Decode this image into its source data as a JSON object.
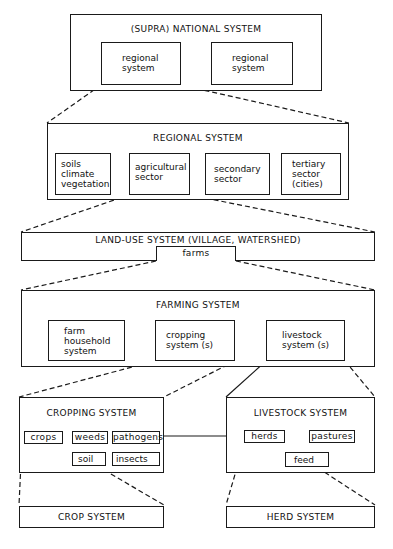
{
  "national": {
    "title": "(SUPRA) NATIONAL SYSTEM",
    "left_box": [
      "regional",
      "system"
    ],
    "right_box": [
      "regional",
      "system"
    ]
  },
  "regional": {
    "title": "REGIONAL SYSTEM",
    "boxes": [
      {
        "lines": [
          "soils",
          "climate",
          "vegetation"
        ]
      },
      {
        "lines": [
          "agricultural",
          "sector"
        ]
      },
      {
        "lines": [
          "secondary",
          "sector"
        ]
      },
      {
        "lines": [
          "tertiary",
          "sector",
          "(cities)"
        ]
      }
    ]
  },
  "landuse": {
    "title": "LAND-USE SYSTEM (VILLAGE, WATERSHED)",
    "farms": "farms"
  },
  "farming": {
    "title": "FARMING SYSTEM",
    "boxes": [
      {
        "lines": [
          "farm",
          "household",
          "system"
        ]
      },
      {
        "lines": [
          "cropping",
          "system (s)"
        ]
      },
      {
        "lines": [
          "livestock",
          "system (s)"
        ]
      }
    ]
  },
  "cropping": {
    "title": "CROPPING SYSTEM",
    "items": {
      "crops": "crops",
      "weeds": "weeds",
      "pathogens": "pathogens",
      "soil": "soil",
      "insects": "insects"
    }
  },
  "livestock": {
    "title": "LIVESTOCK SYSTEM",
    "items": {
      "herds": "herds",
      "pastures": "pastures",
      "feed": "feed"
    }
  },
  "crop_system": {
    "title": "CROP SYSTEM"
  },
  "herd_system": {
    "title": "HERD SYSTEM"
  }
}
